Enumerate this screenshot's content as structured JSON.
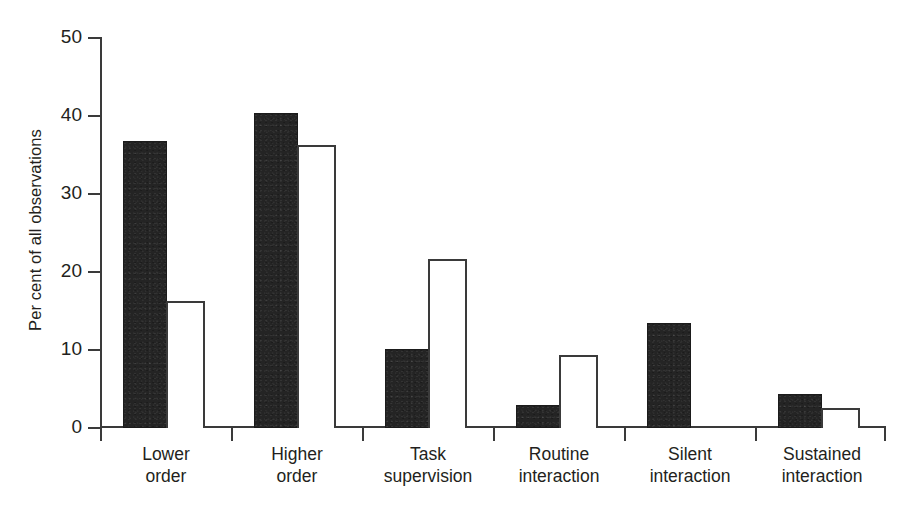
{
  "chart_data": {
    "type": "bar",
    "title": "",
    "subtitle": "",
    "xlabel": "",
    "ylabel": "Per cent of all observations",
    "ylim": [
      0,
      50
    ],
    "yticks": [
      0,
      10,
      20,
      30,
      40,
      50
    ],
    "ytick_labels": [
      "0",
      "10",
      "20",
      "30",
      "40",
      "50"
    ],
    "grid": false,
    "legend": false,
    "legend_position": "none",
    "categories": [
      "Lower order",
      "Higher order",
      "Task supervision",
      "Routine interaction",
      "Silent interaction",
      "Sustained interaction"
    ],
    "category_lines": [
      [
        "Lower",
        "order"
      ],
      [
        "Higher",
        "order"
      ],
      [
        "Task",
        "supervision"
      ],
      [
        "Routine",
        "interaction"
      ],
      [
        "Silent",
        "interaction"
      ],
      [
        "Sustained",
        "interaction"
      ]
    ],
    "series": [
      {
        "name": "filled",
        "style": "solid-black",
        "color": "#242424",
        "values": [
          36.7,
          40.2,
          10.0,
          2.8,
          13.3,
          4.2
        ]
      },
      {
        "name": "open",
        "style": "white-outline",
        "color": "#ffffff",
        "edge_color": "#3a3a3a",
        "values": [
          16.1,
          36.2,
          21.5,
          9.2,
          0,
          2.4
        ]
      }
    ]
  },
  "axis": {
    "y_label": "Per cent of all observations",
    "y_tick_0": "0",
    "y_tick_1": "10",
    "y_tick_2": "20",
    "y_tick_3": "30",
    "y_tick_4": "40",
    "y_tick_5": "50"
  },
  "colors": {
    "dark_bar": "#242424",
    "open_bar_edge": "#3a3a3a",
    "axis": "#3a3a3a",
    "text": "#231f20",
    "background": "#ffffff"
  }
}
